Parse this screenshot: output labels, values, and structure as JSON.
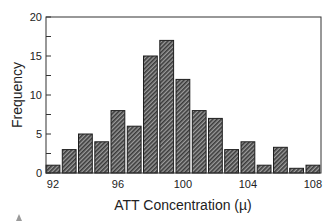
{
  "chart_data": {
    "type": "bar",
    "title": "",
    "xlabel": "ATT Concentration (µ)",
    "ylabel": "Frequency",
    "categories": [
      92,
      93,
      94,
      95,
      96,
      97,
      98,
      99,
      100,
      101,
      102,
      103,
      104,
      105,
      106,
      107,
      108
    ],
    "values": [
      1,
      3,
      5,
      4,
      8,
      6,
      15,
      17,
      12,
      8,
      7,
      3,
      4,
      1,
      3.3,
      0.6,
      1
    ],
    "xlim": [
      91.57,
      108.5
    ],
    "ylim": [
      0,
      20
    ],
    "xticks": [
      92,
      96,
      100,
      104,
      108
    ],
    "yticks": [
      0,
      5,
      10,
      15,
      20
    ],
    "yminor_ticks": [
      2.5,
      7.5,
      12.5,
      17.5
    ],
    "grid": false,
    "legend": null,
    "bar_fill": "diagonal-hatch",
    "colors": {
      "bar_dark": "#3a3a3a",
      "bar_light": "#9c9c9c",
      "bar_edge": "#1e1e1e",
      "axis": "#333333",
      "text": "#222222"
    }
  }
}
